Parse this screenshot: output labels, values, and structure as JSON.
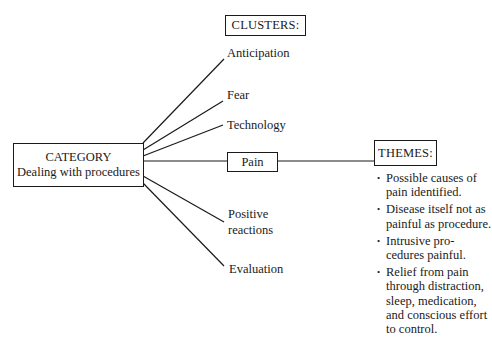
{
  "diagram": {
    "clusters_header": "CLUSTERS:",
    "category": {
      "title": "CATEGORY",
      "subtitle": "Dealing with procedures"
    },
    "clusters": [
      {
        "label": "Anticipation"
      },
      {
        "label": "Fear"
      },
      {
        "label": "Technology"
      },
      {
        "label": "Pain"
      },
      {
        "label": "Positive reactions"
      },
      {
        "label": "Evaluation"
      }
    ],
    "themes_header": "THEMES:",
    "themes": [
      {
        "bullet": "•",
        "text": "Possible causes of pain identified."
      },
      {
        "bullet": "•",
        "text": "Disease itself not as painful as procedure."
      },
      {
        "bullet": "•",
        "text": "Intrusive pro-cedures painful."
      },
      {
        "bullet": "•",
        "text": "Relief from pain through distraction, sleep, medication, and conscious effort to control."
      }
    ]
  }
}
